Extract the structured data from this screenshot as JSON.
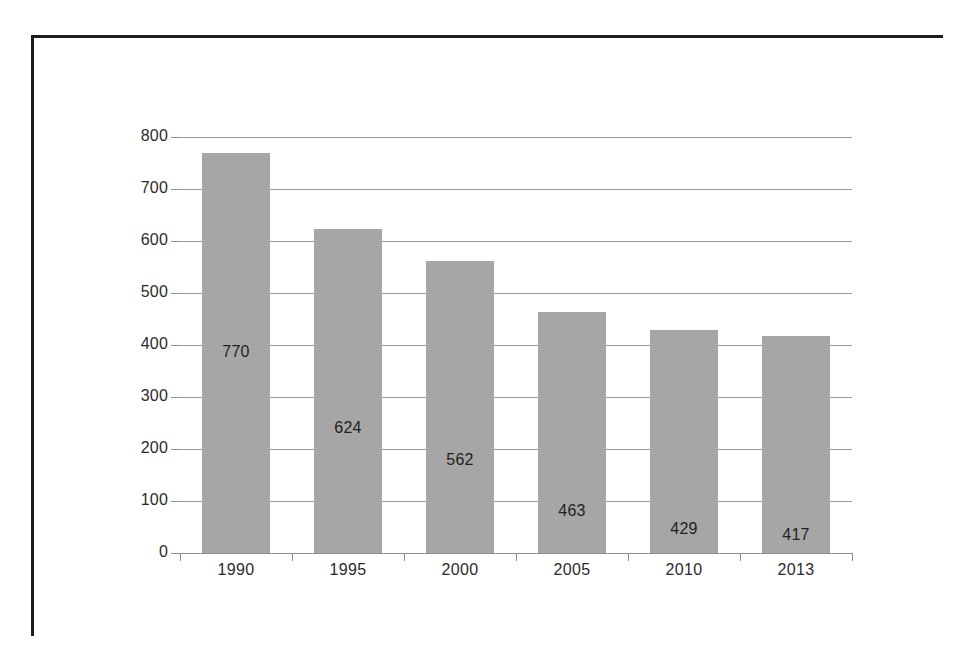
{
  "chart_data": {
    "type": "bar",
    "title": "",
    "subtitle": "",
    "xlabel": "",
    "ylabel": "",
    "categories": [
      "1990",
      "1995",
      "2000",
      "2005",
      "2010",
      "2013"
    ],
    "values": [
      770,
      624,
      562,
      463,
      429,
      417
    ],
    "data_labels": [
      "770",
      "624",
      "562",
      "463",
      "429",
      "417"
    ],
    "ylim": [
      0,
      800
    ],
    "ytick_labels": [
      "0",
      "100",
      "200",
      "300",
      "400",
      "500",
      "600",
      "700",
      "800"
    ],
    "ytick_values": [
      0,
      100,
      200,
      300,
      400,
      500,
      600,
      700,
      800
    ],
    "grid": true,
    "grid_axis": "y",
    "legend": false,
    "legend_position": "none",
    "series": [
      {
        "name": "",
        "values": [
          770,
          624,
          562,
          463,
          429,
          417
        ]
      }
    ]
  },
  "style": {
    "bar_color": "#A6A6A6",
    "gridline_color": "#9A9A9A",
    "axis_color": "#8D8D8D",
    "text_color": "#2B2B2B",
    "label_color": "#1F1F1F",
    "frame_color": "#1D1D1D",
    "background": "#FFFFFF"
  },
  "frame": {
    "top_rule": "page-border-top",
    "left_rule": "page-border-left"
  }
}
